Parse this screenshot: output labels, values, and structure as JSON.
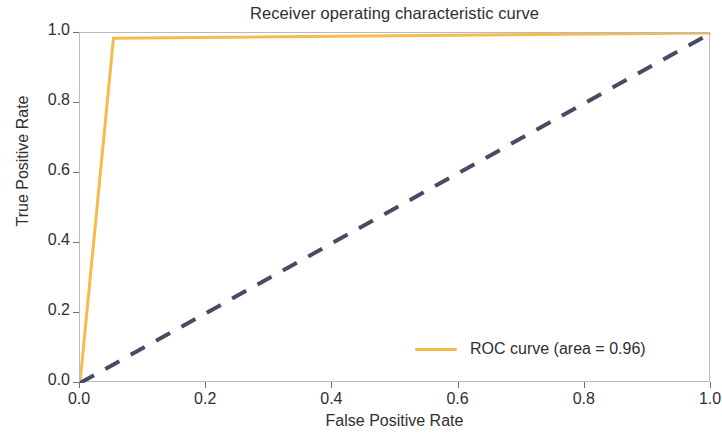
{
  "chart_data": {
    "type": "line",
    "title": "Receiver operating characteristic curve",
    "xlabel": "False Positive Rate",
    "ylabel": "True Positive Rate",
    "xlim": [
      0.0,
      1.0
    ],
    "ylim": [
      0.0,
      1.0
    ],
    "grid": false,
    "legend_position": "lower right",
    "xticks": [
      "0.0",
      "0.2",
      "0.4",
      "0.6",
      "0.8",
      "1.0"
    ],
    "xtick_values": [
      0.0,
      0.2,
      0.4,
      0.6,
      0.8,
      1.0
    ],
    "yticks": [
      "0.0",
      "0.2",
      "0.4",
      "0.6",
      "0.8",
      "1.0"
    ],
    "ytick_values": [
      0.0,
      0.2,
      0.4,
      0.6,
      0.8,
      1.0
    ],
    "auc": 0.96,
    "series": [
      {
        "name": "ROC curve (area = 0.96)",
        "color": "#F7BA4E",
        "linestyle": "solid",
        "linewidth": 3,
        "x": [
          0.0,
          0.053,
          1.0
        ],
        "y": [
          0.0,
          0.985,
          1.0
        ]
      },
      {
        "name": "chance-diagonal",
        "color": "#474B63",
        "linestyle": "dashed",
        "linewidth": 4,
        "x": [
          0.0,
          1.0
        ],
        "y": [
          0.0,
          1.0
        ]
      }
    ]
  },
  "legend": {
    "entries": [
      {
        "label": "ROC curve (area = 0.96)",
        "color": "#F7BA4E"
      }
    ]
  },
  "colors": {
    "roc_curve": "#F7BA4E",
    "chance_line": "#474B63",
    "spine": "#b9b9bb",
    "text": "#2f2f2f",
    "background": "#ffffff"
  }
}
